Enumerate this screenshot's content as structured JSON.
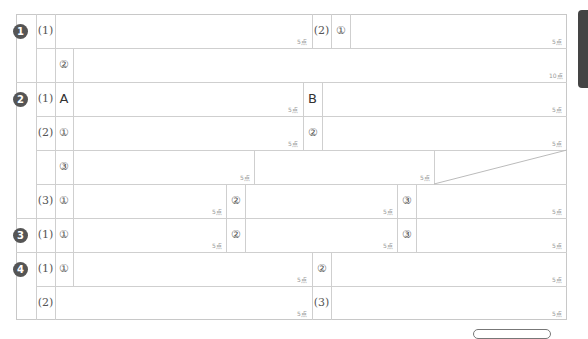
{
  "sheet": {
    "questions": [
      {
        "badge": "1",
        "parts": [
          {
            "label": "(1)",
            "fields": [
              {
                "sub": "",
                "points": "5点"
              }
            ]
          },
          {
            "label": "(2)",
            "fields": [
              {
                "sub": "①",
                "points": "5点"
              },
              {
                "sub": "②",
                "points": "10点"
              }
            ]
          }
        ]
      },
      {
        "badge": "2",
        "parts": [
          {
            "label": "(1)",
            "fields": [
              {
                "sub": "A",
                "points": "5点"
              },
              {
                "sub": "B",
                "points": "5点"
              }
            ]
          },
          {
            "label": "(2)",
            "fields": [
              {
                "sub": "①",
                "points": "5点"
              },
              {
                "sub": "②",
                "points": "5点"
              },
              {
                "sub": "③",
                "points": "5点"
              },
              {
                "sub": "",
                "points": "5点"
              }
            ]
          },
          {
            "label": "(3)",
            "fields": [
              {
                "sub": "①",
                "points": "5点"
              },
              {
                "sub": "②",
                "points": "5点"
              },
              {
                "sub": "③",
                "points": "5点"
              }
            ]
          }
        ]
      },
      {
        "badge": "3",
        "parts": [
          {
            "label": "(1)",
            "fields": [
              {
                "sub": "①",
                "points": "5点"
              },
              {
                "sub": "②",
                "points": "5点"
              },
              {
                "sub": "③",
                "points": "5点"
              }
            ]
          }
        ]
      },
      {
        "badge": "4",
        "parts": [
          {
            "label": "(1)",
            "fields": [
              {
                "sub": "①",
                "points": "5点"
              }
            ]
          },
          {
            "label": "(2)",
            "fields": [
              {
                "sub": "",
                "points": "5点"
              }
            ]
          },
          {
            "label": "(2)",
            "fields": [
              {
                "sub": "②",
                "points": "5点"
              }
            ]
          },
          {
            "label": "(3)",
            "fields": [
              {
                "sub": "",
                "points": "5点"
              }
            ]
          }
        ]
      }
    ]
  },
  "labels": {
    "q1": "1",
    "q2": "2",
    "q3": "3",
    "q4": "4",
    "p1": "(1)",
    "p2": "(2)",
    "p3": "(3)",
    "c1": "①",
    "c2": "②",
    "c3": "③",
    "A": "A",
    "B": "B",
    "pt5": "5点",
    "pt10": "10点"
  },
  "colors": {
    "grid": "#cfcfcf",
    "badge": "#555555",
    "points_text": "#999999"
  }
}
